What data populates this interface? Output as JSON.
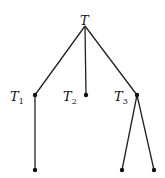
{
  "diagram": {
    "type": "tree",
    "root": {
      "id": "T",
      "label": "T",
      "x": 85,
      "y": 26
    },
    "nodes": [
      {
        "id": "T1",
        "label": "T",
        "sub": "1",
        "x": 35,
        "y": 95
      },
      {
        "id": "T2",
        "label": "T",
        "sub": "2",
        "x": 86,
        "y": 95
      },
      {
        "id": "T3",
        "label": "T",
        "sub": "3",
        "x": 137,
        "y": 95
      },
      {
        "id": "L1",
        "x": 35,
        "y": 170
      },
      {
        "id": "L2",
        "x": 122,
        "y": 170
      },
      {
        "id": "L3",
        "x": 154,
        "y": 170
      }
    ],
    "edges": [
      [
        "T",
        "T1"
      ],
      [
        "T",
        "T2"
      ],
      [
        "T",
        "T3"
      ],
      [
        "T1",
        "L1"
      ],
      [
        "T3",
        "L2"
      ],
      [
        "T3",
        "L3"
      ]
    ],
    "colors": {
      "line": "#222222",
      "node": "#111111"
    }
  }
}
